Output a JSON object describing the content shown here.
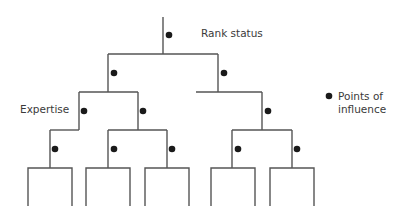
{
  "diagram": {
    "title_labels": {
      "rank_status": "Rank status",
      "expertise": "Expertise"
    },
    "legend": {
      "symbol": "filled-dot",
      "line1": "Points of",
      "line2": "influence"
    },
    "colors": {
      "line": "#555555",
      "dot": "#1a1a1a",
      "text": "#3a3a3a",
      "background": "#ffffff"
    },
    "structure": {
      "root": "Rank status",
      "levels": 4,
      "leaf_count": 5,
      "points_of_influence_count": 10
    }
  }
}
